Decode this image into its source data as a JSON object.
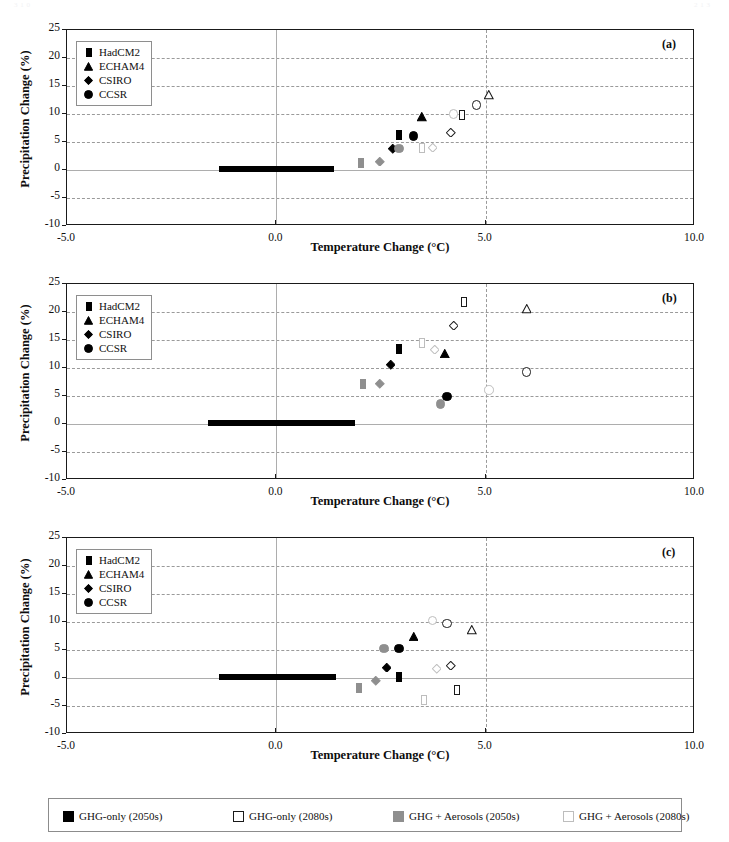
{
  "page": {
    "artifacts": [
      {
        "text": "3 1 0",
        "x": 14,
        "y": 1
      },
      {
        "text": "2 1 3",
        "x": 694,
        "y": 1
      }
    ]
  },
  "axes": {
    "x_title": "Temperature Change (°C)",
    "y_title": "Precipitation Change (%)",
    "x_ticks": [
      "-5.0",
      "0.0",
      "5.0",
      "10.0"
    ],
    "x_tick_values": [
      -5.0,
      0.0,
      5.0,
      10.0
    ],
    "y_ticks": [
      "25",
      "20",
      "15",
      "10",
      "5",
      "0",
      "-5",
      "-10"
    ],
    "y_tick_values": [
      25,
      20,
      15,
      10,
      5,
      0,
      -5,
      -10
    ],
    "xlim": [
      -5.0,
      10.0
    ],
    "ylim": [
      -10,
      25
    ],
    "grid": "horizontal dashed gridlines at every 5% plus vertical dashed line at 5.0 C and vertical solid line at 0.0 C"
  },
  "series_legend": {
    "items": [
      {
        "label": "HadCM2",
        "marker": "square"
      },
      {
        "label": "ECHAM4",
        "marker": "triangle"
      },
      {
        "label": "CSIRO",
        "marker": "diamond"
      },
      {
        "label": "CCSR",
        "marker": "circle"
      }
    ]
  },
  "scenario_legend": {
    "items": [
      {
        "label": "GHG-only (2050s)",
        "fill": "#000000",
        "stroke": "#000000"
      },
      {
        "label": "GHG-only (2080s)",
        "fill": "#ffffff",
        "stroke": "#1a1a1a"
      },
      {
        "label": "GHG + Aerosols (2050s)",
        "fill": "#8f8f8f",
        "stroke": "#8f8f8f"
      },
      {
        "label": "GHG + Aerosols (2080s)",
        "fill": "#ffffff",
        "stroke": "#bdbdbd"
      }
    ]
  },
  "colors": {
    "ghg_2050": "#000000",
    "ghg_2080_stroke": "#1a1a1a",
    "aero_2050": "#8f8f8f",
    "aero_2080_stroke": "#bdbdbd",
    "frame": "#1a1a1a",
    "grid": "#9a9a9a",
    "zero": "#adadad"
  },
  "chart_data": [
    {
      "type": "scatter",
      "panel": "(a)",
      "title": "",
      "xlabel": "Temperature Change (°C)",
      "ylabel": "Precipitation Change (%)",
      "xlim": [
        -5.0,
        10.0
      ],
      "ylim": [
        -10,
        25
      ],
      "grid": true,
      "legend": "inside top-left",
      "baseline_bar": {
        "x_start": -1.35,
        "x_end": 1.4,
        "y": 0
      },
      "points": [
        {
          "model": "HadCM2",
          "scenario": "GHG-only (2050s)",
          "x": 2.95,
          "y": 6.8
        },
        {
          "model": "ECHAM4",
          "scenario": "GHG-only (2050s)",
          "x": 3.5,
          "y": 10.1
        },
        {
          "model": "CSIRO",
          "scenario": "GHG-only (2050s)",
          "x": 2.8,
          "y": 4.4
        },
        {
          "model": "CCSR",
          "scenario": "GHG-only (2050s)",
          "x": 3.3,
          "y": 6.7
        },
        {
          "model": "HadCM2",
          "scenario": "GHG-only (2080s)",
          "x": 4.45,
          "y": 10.3
        },
        {
          "model": "ECHAM4",
          "scenario": "GHG-only (2080s)",
          "x": 5.1,
          "y": 14.0
        },
        {
          "model": "CSIRO",
          "scenario": "GHG-only (2080s)",
          "x": 4.2,
          "y": 7.3
        },
        {
          "model": "CCSR",
          "scenario": "GHG-only (2080s)",
          "x": 4.8,
          "y": 12.2
        },
        {
          "model": "HadCM2",
          "scenario": "GHG + Aerosols (2050s)",
          "x": 2.05,
          "y": 1.7
        },
        {
          "model": "CSIRO",
          "scenario": "GHG + Aerosols (2050s)",
          "x": 2.5,
          "y": 2.1
        },
        {
          "model": "CCSR",
          "scenario": "GHG + Aerosols (2050s)",
          "x": 2.95,
          "y": 4.5
        },
        {
          "model": "HadCM2",
          "scenario": "GHG + Aerosols (2080s)",
          "x": 3.5,
          "y": 4.5
        },
        {
          "model": "CSIRO",
          "scenario": "GHG + Aerosols (2080s)",
          "x": 3.75,
          "y": 4.6
        },
        {
          "model": "CCSR",
          "scenario": "GHG + Aerosols (2080s)",
          "x": 4.25,
          "y": 10.6
        }
      ]
    },
    {
      "type": "scatter",
      "panel": "(b)",
      "title": "",
      "xlabel": "Temperature Change (°C)",
      "ylabel": "Precipitation Change (%)",
      "xlim": [
        -5.0,
        10.0
      ],
      "ylim": [
        -10,
        25
      ],
      "grid": true,
      "legend": "inside top-left",
      "baseline_bar": {
        "x_start": -1.6,
        "x_end": 1.9,
        "y": 0
      },
      "points": [
        {
          "model": "HadCM2",
          "scenario": "GHG-only (2050s)",
          "x": 2.95,
          "y": 13.9
        },
        {
          "model": "ECHAM4",
          "scenario": "GHG-only (2050s)",
          "x": 4.05,
          "y": 13.2
        },
        {
          "model": "CSIRO",
          "scenario": "GHG-only (2050s)",
          "x": 2.75,
          "y": 11.2
        },
        {
          "model": "CCSR",
          "scenario": "GHG-only (2050s)",
          "x": 4.1,
          "y": 5.5
        },
        {
          "model": "HadCM2",
          "scenario": "GHG-only (2080s)",
          "x": 4.5,
          "y": 22.3
        },
        {
          "model": "ECHAM4",
          "scenario": "GHG-only (2080s)",
          "x": 6.0,
          "y": 21.2
        },
        {
          "model": "CSIRO",
          "scenario": "GHG-only (2080s)",
          "x": 4.25,
          "y": 18.2
        },
        {
          "model": "CCSR",
          "scenario": "GHG-only (2080s)",
          "x": 6.0,
          "y": 9.9
        },
        {
          "model": "HadCM2",
          "scenario": "GHG + Aerosols (2050s)",
          "x": 2.1,
          "y": 7.7
        },
        {
          "model": "CSIRO",
          "scenario": "GHG + Aerosols (2050s)",
          "x": 2.5,
          "y": 7.8
        },
        {
          "model": "CCSR",
          "scenario": "GHG + Aerosols (2050s)",
          "x": 3.95,
          "y": 4.2
        },
        {
          "model": "HadCM2",
          "scenario": "GHG + Aerosols (2080s)",
          "x": 3.5,
          "y": 15.0
        },
        {
          "model": "CSIRO",
          "scenario": "GHG + Aerosols (2080s)",
          "x": 3.8,
          "y": 13.9
        },
        {
          "model": "CCSR",
          "scenario": "GHG + Aerosols (2080s)",
          "x": 5.1,
          "y": 6.7
        }
      ]
    },
    {
      "type": "scatter",
      "panel": "(c)",
      "title": "",
      "xlabel": "Temperature Change (°C)",
      "ylabel": "Precipitation Change (%)",
      "xlim": [
        -5.0,
        10.0
      ],
      "ylim": [
        -10,
        25
      ],
      "grid": true,
      "legend": "inside top-left",
      "baseline_bar": {
        "x_start": -1.35,
        "x_end": 1.45,
        "y": 0
      },
      "points": [
        {
          "model": "HadCM2",
          "scenario": "GHG-only (2050s)",
          "x": 2.95,
          "y": 0.7
        },
        {
          "model": "ECHAM4",
          "scenario": "GHG-only (2050s)",
          "x": 3.3,
          "y": 8.0
        },
        {
          "model": "CSIRO",
          "scenario": "GHG-only (2050s)",
          "x": 2.65,
          "y": 2.5
        },
        {
          "model": "CCSR",
          "scenario": "GHG-only (2050s)",
          "x": 2.95,
          "y": 5.9
        },
        {
          "model": "HadCM2",
          "scenario": "GHG-only (2080s)",
          "x": 4.35,
          "y": -1.6
        },
        {
          "model": "ECHAM4",
          "scenario": "GHG-only (2080s)",
          "x": 4.7,
          "y": 9.2
        },
        {
          "model": "CSIRO",
          "scenario": "GHG-only (2080s)",
          "x": 4.2,
          "y": 2.9
        },
        {
          "model": "CCSR",
          "scenario": "GHG-only (2080s)",
          "x": 4.1,
          "y": 10.4
        },
        {
          "model": "HadCM2",
          "scenario": "GHG + Aerosols (2050s)",
          "x": 2.0,
          "y": -1.2
        },
        {
          "model": "CSIRO",
          "scenario": "GHG + Aerosols (2050s)",
          "x": 2.4,
          "y": 0.1
        },
        {
          "model": "CCSR",
          "scenario": "GHG + Aerosols (2050s)",
          "x": 2.6,
          "y": 5.9
        },
        {
          "model": "HadCM2",
          "scenario": "GHG + Aerosols (2080s)",
          "x": 3.55,
          "y": -3.4
        },
        {
          "model": "CSIRO",
          "scenario": "GHG + Aerosols (2080s)",
          "x": 3.85,
          "y": 2.2
        },
        {
          "model": "CCSR",
          "scenario": "GHG + Aerosols (2080s)",
          "x": 3.75,
          "y": 10.9
        }
      ]
    }
  ]
}
